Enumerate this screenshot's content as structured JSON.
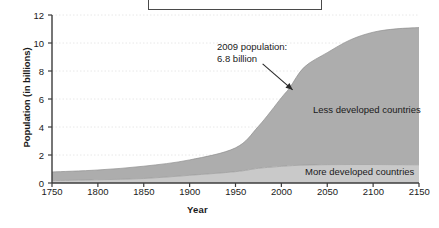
{
  "chart_data": {
    "type": "area",
    "title": "",
    "xlabel": "Year",
    "ylabel": "Population (in billions)",
    "xlim": [
      1750,
      2150
    ],
    "ylim": [
      0,
      12
    ],
    "xticks": [
      1750,
      1800,
      1850,
      1900,
      1950,
      2000,
      2050,
      2100,
      2150
    ],
    "yticks": [
      0,
      2,
      4,
      6,
      8,
      10,
      12
    ],
    "grid": true,
    "stacked": true,
    "legend_position": "inline-labels",
    "annotations": [
      {
        "name": "population-2009",
        "line1": "2009 population:",
        "line2": "6.8 billion",
        "points_to_x": 2009,
        "points_to_y": 6.8
      }
    ],
    "x": [
      1750,
      1800,
      1850,
      1900,
      1950,
      1975,
      2000,
      2009,
      2025,
      2050,
      2075,
      2100,
      2125,
      2150
    ],
    "series": [
      {
        "name": "More developed countries",
        "color": "#c9c9c9",
        "values": [
          0.17,
          0.23,
          0.32,
          0.55,
          0.81,
          1.05,
          1.19,
          1.23,
          1.28,
          1.31,
          1.32,
          1.32,
          1.31,
          1.3
        ]
      },
      {
        "name": "Less developed countries",
        "color": "#adadad",
        "values": [
          0.62,
          0.7,
          0.88,
          1.1,
          1.7,
          3.0,
          4.9,
          5.57,
          7.0,
          8.0,
          8.9,
          9.45,
          9.7,
          9.8
        ]
      }
    ],
    "totals": [
      0.79,
      0.93,
      1.2,
      1.65,
      2.51,
      4.05,
      6.09,
      6.8,
      8.28,
      9.31,
      10.22,
      10.77,
      11.01,
      11.1
    ]
  },
  "axes": {
    "y_title": "Population (in billions)",
    "x_title": "Year",
    "y_tick_labels": [
      "12",
      "10",
      "8",
      "6",
      "4",
      "2",
      "0"
    ],
    "x_tick_labels": [
      "1750",
      "1800",
      "1850",
      "1900",
      "1950",
      "2000",
      "2050",
      "2100",
      "2150"
    ]
  },
  "labels": {
    "less_developed": "Less developed countries",
    "more_developed": "More developed countries"
  },
  "annotation": {
    "line1": "2009 population:",
    "line2": "6.8 billion"
  },
  "colors": {
    "less_developed_fill": "#adadad",
    "more_developed_fill": "#c9c9c9",
    "axis": "#3c3c3c",
    "grid": "#e8e8e8",
    "text": "#1a1a1a",
    "title_box_border": "#4a4a4a"
  }
}
